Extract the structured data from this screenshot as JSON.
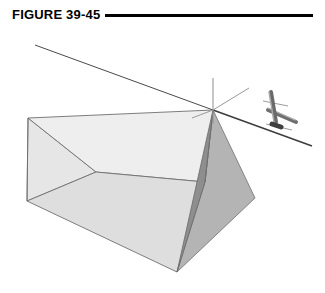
{
  "figure": {
    "caption_label": "FIGURE 39-45",
    "rule": {
      "x": 105,
      "y": 14,
      "width": 208,
      "height": 3,
      "color": "#000000"
    }
  },
  "colors": {
    "background": "#ffffff",
    "ink": "#000000",
    "top_face": "#eeeeee",
    "front_left_face": "#dedede",
    "gable_dark_face": "#8e8e8e",
    "right_face": "#b4b4b4",
    "edge_stroke": "#6b6b6b",
    "ray_stroke": "#4a4a4a",
    "normal_stroke": "#9a9a9a",
    "marker_dark": "#5a5a5a",
    "marker_mid": "#8a8a8a",
    "marker_light": "#b8b8b8"
  },
  "scene": {
    "description": "Triangular prism drawn in oblique view with an incident light ray, normal lines at the point of incidence, and a small three-dimensional axis marker at the right.",
    "prism": {
      "name": "triangular-prism",
      "vertices": {
        "apex_right": [
          213,
          110
        ],
        "top_back_left": [
          28,
          118
        ],
        "top_front_left": [
          96,
          172
        ],
        "bottom_front_left": [
          27,
          201
        ],
        "bottom_vertex": [
          177,
          272
        ],
        "right_vertex": [
          255,
          198
        ],
        "ridge_mid": [
          205,
          182
        ]
      },
      "faces": [
        {
          "name": "top-face",
          "fill": "#eeeeee",
          "points": "28,118 213,110 205,182 96,172"
        },
        {
          "name": "front-left-face",
          "fill": "#dedede",
          "points": "27,201 96,172 205,182 177,272"
        },
        {
          "name": "gable-dark-face",
          "fill": "#8e8e8e",
          "points": "213,110 205,182 177,272"
        },
        {
          "name": "right-face",
          "fill": "#b4b4b4",
          "points": "213,110 255,198 177,272 205,182"
        },
        {
          "name": "left-end-face",
          "fill": "#e6e6e6",
          "points": "28,118 96,172 27,201"
        }
      ]
    },
    "rays": [
      {
        "name": "incident-ray",
        "from": [
          35,
          45
        ],
        "to": [
          213,
          110
        ],
        "stroke": "#4a4a4a",
        "width": 1
      },
      {
        "name": "transmitted-ray",
        "from": [
          213,
          110
        ],
        "to": [
          312,
          146
        ],
        "stroke": "#3c3c3c",
        "width": 1.6
      }
    ],
    "normals": [
      {
        "name": "vertical-normal",
        "from": [
          213,
          78
        ],
        "to": [
          213,
          124
        ],
        "stroke": "#8f8f8f",
        "width": 1
      },
      {
        "name": "upper-right-normal",
        "from": [
          213,
          110
        ],
        "to": [
          249,
          88
        ],
        "stroke": "#9a9a9a",
        "width": 1
      },
      {
        "name": "left-normal-stub",
        "from": [
          213,
          110
        ],
        "to": [
          192,
          118
        ],
        "stroke": "#9a9a9a",
        "width": 1
      }
    ],
    "axis_marker": {
      "name": "axis-marker",
      "center": [
        278,
        118
      ],
      "parts": [
        {
          "name": "marker-vertical-post",
          "from": [
            271,
            92
          ],
          "to": [
            276,
            122
          ],
          "stroke": "#6a6a6a",
          "width": 4
        },
        {
          "name": "marker-vertical-post-highlight",
          "from": [
            269,
            92
          ],
          "to": [
            274,
            122
          ],
          "stroke": "#a8a8a8",
          "width": 1.5
        },
        {
          "name": "marker-diagonal-arm",
          "from": [
            268,
            110
          ],
          "to": [
            296,
            122
          ],
          "stroke": "#6f6f6f",
          "width": 4
        },
        {
          "name": "marker-cross-bar-upper",
          "from": [
            263,
            101
          ],
          "to": [
            288,
            106
          ],
          "stroke": "#9d9d9d",
          "width": 1
        },
        {
          "name": "marker-cross-bar-lower",
          "from": [
            266,
            124
          ],
          "to": [
            292,
            130
          ],
          "stroke": "#9d9d9d",
          "width": 1
        },
        {
          "name": "marker-base-node",
          "from": [
            272,
            124
          ],
          "to": [
            281,
            127
          ],
          "stroke": "#3f3f3f",
          "width": 5
        }
      ]
    }
  }
}
